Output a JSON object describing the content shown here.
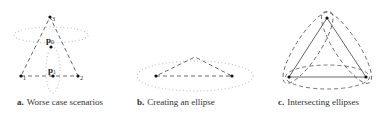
{
  "panels": [
    {
      "letter": "a.",
      "caption": "Worse case scenarios",
      "vertices": [
        {
          "label": "1",
          "x": 21,
          "y": 76
        },
        {
          "label": "2",
          "x": 78,
          "y": 76
        },
        {
          "label": "3",
          "x": 50,
          "y": 17
        }
      ],
      "points": [
        {
          "label": "p",
          "sub": "0",
          "x": 51,
          "y": 47
        },
        {
          "label": "p",
          "sub": "1",
          "x": 53,
          "y": 76
        }
      ]
    },
    {
      "letter": "b.",
      "caption": "Creating an ellipse",
      "vertices": [
        {
          "x": 156,
          "y": 76
        },
        {
          "x": 232,
          "y": 76
        },
        {
          "x": 195,
          "y": 57
        }
      ]
    },
    {
      "letter": "c.",
      "caption": "Intersecting ellipses",
      "vertices": [
        {
          "x": 289,
          "y": 77
        },
        {
          "x": 366,
          "y": 77
        },
        {
          "x": 327,
          "y": 18
        }
      ]
    }
  ],
  "colors": {
    "line": "#444444",
    "dotted": "#bbbbbb",
    "point": "#111111"
  }
}
